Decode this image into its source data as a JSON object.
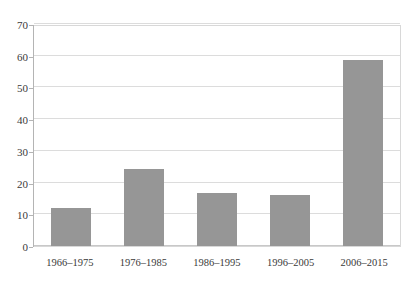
{
  "chart_data": {
    "type": "bar",
    "title": "",
    "subtitle": "",
    "xlabel": "",
    "ylabel": "",
    "categories": [
      "1966–1975",
      "1976–1985",
      "1986–1995",
      "1996–2005",
      "2006–2015"
    ],
    "values": [
      12,
      24.3,
      16.7,
      16.2,
      58.5
    ],
    "ylim": [
      0,
      70
    ],
    "yticks": [
      0,
      10,
      20,
      30,
      40,
      50,
      60,
      70
    ],
    "ytick_labels": [
      "0",
      "10",
      "20",
      "30",
      "40",
      "50",
      "60",
      "70"
    ],
    "grid": true,
    "grid_axis": "y",
    "legend": false,
    "legend_position": "none",
    "annotations": []
  },
  "style": {
    "bar_color": "#969696",
    "grid_color": "#dcdcdc",
    "axis_color": "#b4b4b4",
    "plot_border_color": "#d8d8d8",
    "background_color": "#ffffff",
    "text_color": "#3a3a3a"
  }
}
